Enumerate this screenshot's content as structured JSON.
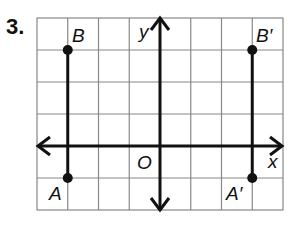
{
  "problem": {
    "number": "3."
  },
  "graph": {
    "grid": {
      "columns": 8,
      "rows": 6,
      "line_color": "#888888"
    },
    "axes": {
      "x_label": "x",
      "y_label": "y",
      "origin_label": "O"
    },
    "points": [
      {
        "label": "B",
        "x": -3,
        "y": 4
      },
      {
        "label": "A",
        "x": -3,
        "y": -1
      },
      {
        "label": "B′",
        "x": 3,
        "y": 4
      },
      {
        "label": "A′",
        "x": 3,
        "y": -1
      }
    ],
    "segments": [
      {
        "from": "A",
        "to": "B"
      },
      {
        "from": "A′",
        "to": "B′"
      }
    ]
  }
}
